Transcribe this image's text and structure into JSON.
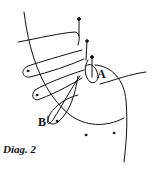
{
  "diagram": {
    "caption": "Diag. 2",
    "labels": {
      "a": "A",
      "b": "B"
    },
    "colors": {
      "stroke": "#111111",
      "background": "#ffffff"
    }
  }
}
